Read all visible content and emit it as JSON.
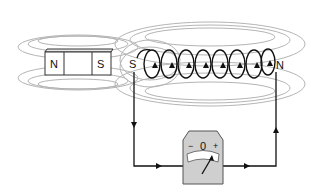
{
  "diagram": {
    "magnet": {
      "left_pole": "N",
      "right_pole": "S"
    },
    "coil": {
      "left_end": "S",
      "right_end": "N",
      "turns": 8
    },
    "galvanometer": {
      "minus": "−",
      "zero": "0",
      "plus": "+"
    },
    "colors": {
      "field_lines": "#b4b4b4",
      "wire": "#111111",
      "meter_body": "#cfcfcf",
      "meter_face": "#ffffff"
    }
  }
}
